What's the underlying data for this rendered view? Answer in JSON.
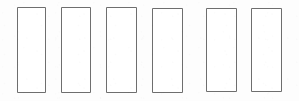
{
  "figure": {
    "kind": "line-drawing",
    "width": 299,
    "height": 101,
    "background_color": "#fdfdfd",
    "stroke_color": "#6e6e6e",
    "fill_color": "#ffffff",
    "stroke_width": 1,
    "shape_count": 6,
    "shape_label": "rectangle"
  },
  "shapes": [
    {
      "name": "rectangle-1",
      "index": 1,
      "x": 17,
      "y": 7,
      "width": 28,
      "height": 85,
      "label": ""
    },
    {
      "name": "rectangle-2",
      "index": 2,
      "x": 61,
      "y": 7,
      "width": 29,
      "height": 85,
      "label": ""
    },
    {
      "name": "rectangle-3",
      "index": 3,
      "x": 106,
      "y": 7,
      "width": 30,
      "height": 85,
      "label": ""
    },
    {
      "name": "rectangle-4",
      "index": 4,
      "x": 152,
      "y": 8,
      "width": 30,
      "height": 84,
      "label": ""
    },
    {
      "name": "rectangle-5",
      "index": 5,
      "x": 206,
      "y": 8,
      "width": 30,
      "height": 83,
      "label": ""
    },
    {
      "name": "rectangle-6",
      "index": 6,
      "x": 251,
      "y": 8,
      "width": 30,
      "height": 83,
      "label": ""
    }
  ]
}
